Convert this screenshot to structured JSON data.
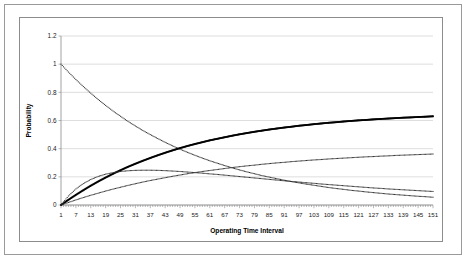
{
  "chart_data": {
    "type": "line",
    "title": "",
    "xlabel": "Operating Time Interval",
    "ylabel": "Probability",
    "xlim": [
      1,
      151
    ],
    "ylim": [
      0,
      1.2
    ],
    "grid": true,
    "legend_position": "none",
    "ytick_labels": [
      "0",
      "0.2",
      "0.4",
      "0.6",
      "0.8",
      "1",
      "1.2"
    ],
    "ytick_values": [
      0,
      0.2,
      0.4,
      0.6,
      0.8,
      1,
      1.2
    ],
    "xtick_labels": [
      "1",
      "7",
      "13",
      "19",
      "25",
      "31",
      "37",
      "43",
      "49",
      "55",
      "61",
      "67",
      "73",
      "79",
      "85",
      "91",
      "97",
      "103",
      "109",
      "115",
      "121",
      "127",
      "133",
      "139",
      "145",
      "151"
    ],
    "xtick_values": [
      1,
      7,
      13,
      19,
      25,
      31,
      37,
      43,
      49,
      55,
      61,
      67,
      73,
      79,
      85,
      91,
      97,
      103,
      109,
      115,
      121,
      127,
      133,
      139,
      145,
      151
    ],
    "x": [
      1,
      4,
      7,
      10,
      13,
      16,
      19,
      22,
      25,
      28,
      31,
      34,
      37,
      40,
      43,
      46,
      49,
      52,
      55,
      58,
      61,
      64,
      67,
      70,
      73,
      76,
      79,
      82,
      85,
      88,
      91,
      94,
      97,
      100,
      103,
      106,
      109,
      112,
      115,
      118,
      121,
      124,
      127,
      130,
      133,
      136,
      139,
      142,
      145,
      148,
      151
    ],
    "series": [
      {
        "name": "decaying-state",
        "marker": "dot",
        "weight": "thin",
        "color": "#303030",
        "values": [
          1.0,
          0.944,
          0.891,
          0.841,
          0.794,
          0.749,
          0.707,
          0.667,
          0.63,
          0.594,
          0.561,
          0.529,
          0.5,
          0.472,
          0.445,
          0.42,
          0.396,
          0.374,
          0.353,
          0.333,
          0.314,
          0.297,
          0.28,
          0.264,
          0.249,
          0.235,
          0.222,
          0.209,
          0.198,
          0.187,
          0.176,
          0.166,
          0.157,
          0.148,
          0.14,
          0.132,
          0.124,
          0.117,
          0.111,
          0.104,
          0.099,
          0.093,
          0.088,
          0.083,
          0.078,
          0.074,
          0.07,
          0.066,
          0.062,
          0.059,
          0.055
        ]
      },
      {
        "name": "dominant-state",
        "marker": "dot",
        "weight": "bold",
        "color": "#000000",
        "values": [
          0.0,
          0.037,
          0.072,
          0.105,
          0.137,
          0.167,
          0.195,
          0.222,
          0.247,
          0.271,
          0.293,
          0.314,
          0.334,
          0.353,
          0.371,
          0.388,
          0.404,
          0.419,
          0.433,
          0.446,
          0.459,
          0.47,
          0.481,
          0.492,
          0.502,
          0.511,
          0.52,
          0.528,
          0.536,
          0.543,
          0.55,
          0.556,
          0.563,
          0.568,
          0.574,
          0.579,
          0.584,
          0.588,
          0.593,
          0.597,
          0.601,
          0.604,
          0.608,
          0.611,
          0.614,
          0.617,
          0.62,
          0.622,
          0.625,
          0.627,
          0.63
        ]
      },
      {
        "name": "intermediate-state",
        "marker": "dot",
        "weight": "thin",
        "color": "#303030",
        "values": [
          0.0,
          0.018,
          0.036,
          0.053,
          0.069,
          0.084,
          0.099,
          0.113,
          0.126,
          0.139,
          0.151,
          0.163,
          0.174,
          0.184,
          0.194,
          0.204,
          0.213,
          0.222,
          0.23,
          0.238,
          0.245,
          0.252,
          0.259,
          0.266,
          0.272,
          0.278,
          0.283,
          0.289,
          0.294,
          0.299,
          0.303,
          0.308,
          0.312,
          0.316,
          0.32,
          0.323,
          0.327,
          0.33,
          0.333,
          0.336,
          0.339,
          0.342,
          0.344,
          0.347,
          0.349,
          0.352,
          0.354,
          0.356,
          0.358,
          0.36,
          0.362
        ]
      },
      {
        "name": "transient-state",
        "marker": "dot",
        "weight": "thin",
        "color": "#303030",
        "values": [
          0.0,
          0.064,
          0.114,
          0.152,
          0.181,
          0.203,
          0.219,
          0.23,
          0.238,
          0.243,
          0.246,
          0.247,
          0.247,
          0.246,
          0.244,
          0.241,
          0.238,
          0.234,
          0.23,
          0.226,
          0.221,
          0.217,
          0.212,
          0.207,
          0.202,
          0.197,
          0.192,
          0.187,
          0.182,
          0.177,
          0.172,
          0.167,
          0.163,
          0.158,
          0.154,
          0.149,
          0.145,
          0.141,
          0.137,
          0.133,
          0.129,
          0.125,
          0.121,
          0.118,
          0.114,
          0.111,
          0.108,
          0.105,
          0.102,
          0.099,
          0.096
        ]
      }
    ]
  }
}
